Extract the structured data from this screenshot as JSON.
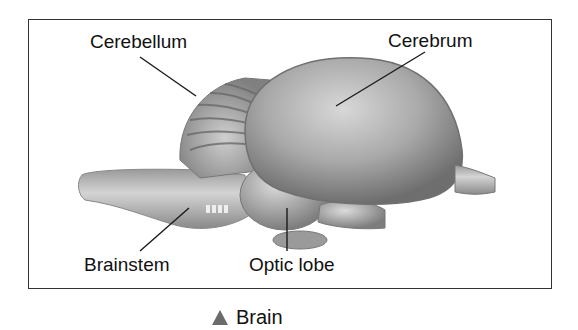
{
  "figure": {
    "caption": "Brain",
    "caption_marker_color": "#6b6b6b"
  },
  "labels": {
    "cerebellum": "Cerebellum",
    "cerebrum": "Cerebrum",
    "brainstem": "Brainstem",
    "optic_lobe": "Optic lobe"
  }
}
